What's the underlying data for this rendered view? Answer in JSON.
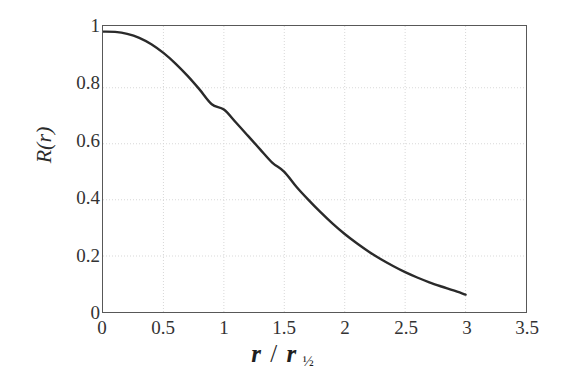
{
  "chart_data": {
    "type": "line",
    "title": "",
    "subtitle": "",
    "xlabel": "r / r½",
    "ylabel": "R(r)",
    "xlim": [
      0,
      3.5
    ],
    "ylim": [
      0,
      1.02
    ],
    "grid": true,
    "legend": null,
    "legend_position": "none",
    "xticks": [
      "0",
      "0.5",
      "1",
      "1.5",
      "2",
      "2.5",
      "3",
      "3.5"
    ],
    "xtick_values": [
      0,
      0.5,
      1,
      1.5,
      2,
      2.5,
      3,
      3.5
    ],
    "yticks": [
      "0",
      "0.2",
      "0.4",
      "0.6",
      "0.8",
      "1"
    ],
    "ytick_values": [
      0,
      0.2,
      0.4,
      0.6,
      0.8,
      1
    ],
    "series": [
      {
        "name": "R(r)",
        "color": "#2a2a2a",
        "line_width": 2.4,
        "x": [
          0.0,
          0.1,
          0.2,
          0.3,
          0.4,
          0.5,
          0.6,
          0.7,
          0.8,
          0.9,
          1.0,
          1.1,
          1.2,
          1.3,
          1.4,
          1.5,
          1.6,
          1.7,
          1.8,
          1.9,
          2.0,
          2.1,
          2.2,
          2.3,
          2.4,
          2.5,
          2.6,
          2.7,
          2.8,
          2.9,
          3.0
        ],
        "values": [
          1.0,
          0.999,
          0.992,
          0.978,
          0.955,
          0.924,
          0.886,
          0.842,
          0.793,
          0.741,
          0.722,
          0.676,
          0.628,
          0.58,
          0.533,
          0.5,
          0.447,
          0.4,
          0.356,
          0.315,
          0.278,
          0.245,
          0.215,
          0.188,
          0.164,
          0.142,
          0.123,
          0.106,
          0.091,
          0.077,
          0.062
        ]
      }
    ],
    "annotations": []
  },
  "axis": {
    "x_title_parts": {
      "numerator": "r",
      "slash": "/",
      "denominator": "r",
      "subscript": "½"
    },
    "y_title": "R(r)"
  },
  "style": {
    "frame_color": "#585858",
    "grid_color": "#d8d8d8",
    "curve_color": "#2a2a2a",
    "background": "#ffffff",
    "text_color": "#333333"
  }
}
